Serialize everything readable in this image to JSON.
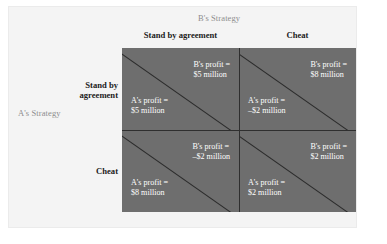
{
  "axis_titles": {
    "columns": "B's Strategy",
    "rows": "A's Strategy"
  },
  "column_headers": [
    "Stand by agreement",
    "Cheat"
  ],
  "row_headers": [
    "Stand by\nagreement",
    "Cheat"
  ],
  "row_headers_line1": [
    "Stand by",
    "Cheat"
  ],
  "row_headers_line2": [
    "agreement",
    ""
  ],
  "colors": {
    "cell_fill": "#6e6e6e",
    "grid_line": "#2f2f2f",
    "diagonal": "#2b2b2b",
    "payoff_text": "#ffffff",
    "header_text": "#1b1b1b",
    "axis_title_text": "#8d8d8d",
    "panel": "#f4f4f4",
    "page_background": "#ffffff"
  },
  "chart_data": {
    "type": "table",
    "title": "",
    "xlabel": "B's Strategy",
    "ylabel": "A's Strategy",
    "categories_x": [
      "Stand by agreement",
      "Cheat"
    ],
    "categories_y": [
      "Stand by agreement",
      "Cheat"
    ],
    "cells": [
      {
        "row": 0,
        "col": 0,
        "b_label_line1": "B's profit =",
        "b_label_line2": "$5 million",
        "a_label_line1": "A's profit =",
        "a_label_line2": "$5 million",
        "a_value": 5,
        "b_value": 5
      },
      {
        "row": 0,
        "col": 1,
        "b_label_line1": "B's profit =",
        "b_label_line2": "$8 million",
        "a_label_line1": "A's profit =",
        "a_label_line2": "–$2 million",
        "a_value": -2,
        "b_value": 8
      },
      {
        "row": 1,
        "col": 0,
        "b_label_line1": "B's profit =",
        "b_label_line2": "–$2 million",
        "a_label_line1": "A's profit =",
        "a_label_line2": "$8 million",
        "a_value": 8,
        "b_value": -2
      },
      {
        "row": 1,
        "col": 1,
        "b_label_line1": "B's profit =",
        "b_label_line2": "$2 million",
        "a_label_line1": "A's profit =",
        "a_label_line2": "$2 million",
        "a_value": 2,
        "b_value": 2
      }
    ]
  }
}
